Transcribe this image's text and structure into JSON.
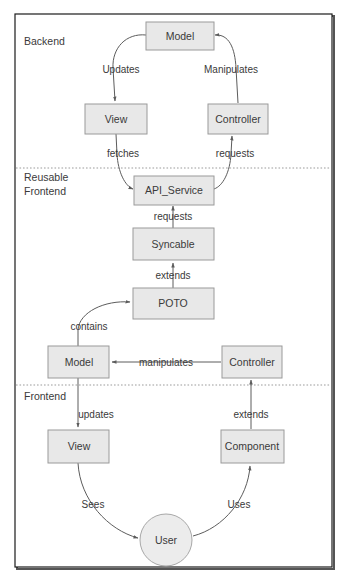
{
  "diagram": {
    "type": "flow-diagram",
    "colors": {
      "node_fill": "#e8e8e8",
      "node_stroke": "#9a9a9a",
      "edge_stroke": "#5c5c5c",
      "text": "#3a3a3a",
      "frame": "#1c1c1c",
      "background": "#ffffff"
    },
    "zones": [
      {
        "id": "backend",
        "label": "Backend"
      },
      {
        "id": "reusable-frontend",
        "label_line1": "Reusable",
        "label_line2": "Frontend"
      },
      {
        "id": "frontend",
        "label": "Frontend"
      }
    ],
    "nodes": [
      {
        "id": "backend-model",
        "label": "Model",
        "shape": "rect",
        "zone": "backend"
      },
      {
        "id": "backend-view",
        "label": "View",
        "shape": "rect",
        "zone": "backend"
      },
      {
        "id": "backend-controller",
        "label": "Controller",
        "shape": "rect",
        "zone": "backend"
      },
      {
        "id": "api-service",
        "label": "API_Service",
        "shape": "rect",
        "zone": "reusable-frontend"
      },
      {
        "id": "syncable",
        "label": "Syncable",
        "shape": "rect",
        "zone": "reusable-frontend"
      },
      {
        "id": "poto",
        "label": "POTO",
        "shape": "rect",
        "zone": "reusable-frontend"
      },
      {
        "id": "frontend-model",
        "label": "Model",
        "shape": "rect",
        "zone": "reusable-frontend"
      },
      {
        "id": "frontend-controller",
        "label": "Controller",
        "shape": "rect",
        "zone": "reusable-frontend"
      },
      {
        "id": "frontend-view",
        "label": "View",
        "shape": "rect",
        "zone": "frontend"
      },
      {
        "id": "frontend-component",
        "label": "Component",
        "shape": "rect",
        "zone": "frontend"
      },
      {
        "id": "user",
        "label": "User",
        "shape": "circle",
        "zone": "frontend"
      }
    ],
    "edges": [
      {
        "id": "model-to-view",
        "from": "backend-model",
        "to": "backend-view",
        "label": "Updates"
      },
      {
        "id": "controller-to-model",
        "from": "backend-controller",
        "to": "backend-model",
        "label": "Manipulates"
      },
      {
        "id": "view-to-api",
        "from": "backend-view",
        "to": "api-service",
        "label": "fetches"
      },
      {
        "id": "api-to-controller",
        "from": "api-service",
        "to": "backend-controller",
        "label": "requests"
      },
      {
        "id": "syncable-to-api",
        "from": "syncable",
        "to": "api-service",
        "label": "requests"
      },
      {
        "id": "poto-to-syncable",
        "from": "poto",
        "to": "syncable",
        "label": "extends"
      },
      {
        "id": "model-to-poto",
        "from": "frontend-model",
        "to": "poto",
        "label": "contains"
      },
      {
        "id": "controller-to-model-2",
        "from": "frontend-controller",
        "to": "frontend-model",
        "label": "manipulates"
      },
      {
        "id": "model-to-view-2",
        "from": "frontend-model",
        "to": "frontend-view",
        "label": "updates"
      },
      {
        "id": "component-to-controller",
        "from": "frontend-component",
        "to": "frontend-controller",
        "label": "extends"
      },
      {
        "id": "view-to-user",
        "from": "frontend-view",
        "to": "user",
        "label": "Sees"
      },
      {
        "id": "user-to-component",
        "from": "user",
        "to": "frontend-component",
        "label": "Uses"
      }
    ]
  }
}
